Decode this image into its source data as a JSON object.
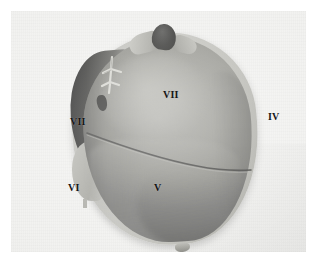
{
  "image": {
    "kind": "anatomical-specimen-photograph",
    "subject": "Liver specimen, posterior view",
    "rendering": "grayscale photograph on light plate with white border margin",
    "width_px": 319,
    "height_px": 267
  },
  "plate": {
    "background_color": "#f2f2f0",
    "margin_color": "#ffffff",
    "margin_px": 11
  },
  "specimen": {
    "name": "liver-specimen",
    "body_color": "#9a9a94",
    "rim_color": "#c2c2bd",
    "shadow_color": "#2c2c2c",
    "parts": [
      {
        "name": "vessel-stump-top",
        "color": "#3a3a38",
        "description": "dark vascular stump at superior pole"
      },
      {
        "name": "tissue-flap-left",
        "color": "#b6b6b0",
        "description": "pale tissue flap left of stump"
      },
      {
        "name": "tissue-flap-right",
        "color": "#b0b0aa",
        "description": "pale tissue flap right of stump"
      },
      {
        "name": "vessel-branch-upper-left",
        "color": "#d2d2cc",
        "description": "branching whitish vessel on upper-left margin"
      },
      {
        "name": "interlobar-fissure",
        "color": "#4a4a48",
        "description": "curved dividing line between segments"
      },
      {
        "name": "vessel-stub-inferior",
        "color": "#a6a6a0",
        "description": "small stub at inferior border"
      }
    ]
  },
  "labels": [
    {
      "id": "label-vii-outer",
      "text": "VII",
      "position": "upper-left, off specimen"
    },
    {
      "id": "label-vi-outer",
      "text": "VI",
      "position": "lower-left, off specimen"
    },
    {
      "id": "label-iv-outer",
      "text": "IV",
      "position": "right, off specimen"
    },
    {
      "id": "label-vii-inner",
      "text": "VII",
      "position": "upper segment, on specimen"
    },
    {
      "id": "label-v-inner",
      "text": "V",
      "position": "lower segment, on specimen"
    }
  ]
}
